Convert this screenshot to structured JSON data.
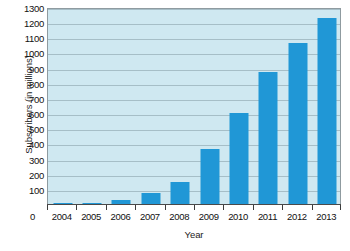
{
  "chart_data": {
    "type": "bar",
    "title": "",
    "xlabel": "Year",
    "ylabel": "Subscribers (in millions)",
    "categories": [
      "2004",
      "2005",
      "2006",
      "2007",
      "2008",
      "2009",
      "2010",
      "2011",
      "2012",
      "2013"
    ],
    "values": [
      2,
      8,
      25,
      70,
      145,
      360,
      600,
      870,
      1060,
      1230
    ],
    "series": [
      {
        "name": "Subscribers",
        "values": [
          2,
          8,
          25,
          70,
          145,
          360,
          600,
          870,
          1060,
          1230
        ]
      }
    ],
    "ylim": [
      0,
      1300
    ],
    "ytick_step": 100,
    "yticks": [
      100,
      200,
      300,
      400,
      500,
      600,
      700,
      800,
      900,
      1000,
      1100,
      1200,
      1300
    ],
    "ytick_labels": [
      "100",
      "200",
      "300",
      "400",
      "500",
      "600",
      "700",
      "800",
      "900",
      "1000",
      "1100",
      "1200",
      "1300"
    ],
    "origin_label": "0",
    "grid": true,
    "legend": false,
    "legend_position": "none",
    "colors": {
      "bar": "#2097d6",
      "plot_background": "#cfe8f1",
      "gridline": "#9fb6bf",
      "axis": "#4a4a4a",
      "text": "#111111"
    }
  }
}
